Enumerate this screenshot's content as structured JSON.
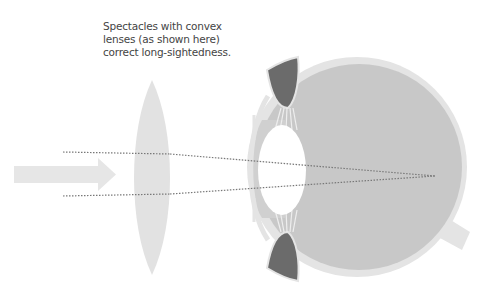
{
  "caption": {
    "lines": [
      "Spectacles with convex",
      "lenses (as shown here)",
      "correct long-sightedness."
    ]
  },
  "diagram": {
    "elements": [
      "incoming-light-arrow",
      "convex-spectacle-lens",
      "light-rays",
      "cornea",
      "iris",
      "ciliary-muscle",
      "eye-lens",
      "vitreous-body",
      "sclera",
      "optic-nerve",
      "focal-point"
    ],
    "colors": {
      "arrow": "#e6e6e6",
      "spectacle_lens": "#e2e2e2",
      "sclera": "#e4e4e4",
      "vitreous": "#c8c8c8",
      "cornea": "#d2d2d2",
      "iris": "#6b6b6b",
      "eye_lens": "#ffffff",
      "rays": "#777777"
    }
  }
}
